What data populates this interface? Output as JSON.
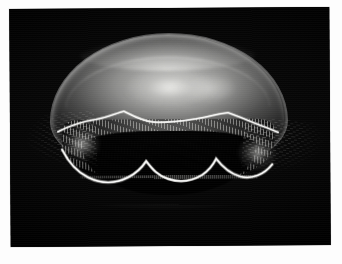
{
  "page": {
    "background_color": "#ffffff",
    "width": 342,
    "height": 264
  },
  "photo": {
    "subject": "moon-jellyfish",
    "subject_common_name": "Moon jellyfish",
    "background_color": "#000000",
    "frame_border_color": "#d8d8d8",
    "alt_text": "A translucent moon jellyfish photographed against a solid black background, its domed bell glowing pale grey with a bright scalloped margin and fine hair-like tentacles trailing below and to each side.",
    "orientation": "landscape",
    "plate": {
      "left": 10,
      "top": 8,
      "width": 320,
      "height": 238
    }
  },
  "subject_parts": {
    "bell_label": "bell-dome",
    "gonad_label": "gonad-ring",
    "margin_label": "scalloped-bell-margin",
    "tentacle_label": "tentacle-fringe",
    "oral_arm_label": "oral-arms",
    "wisp_left_label": "left-tentacle-spray",
    "wisp_right_label": "right-tentacle-spray"
  },
  "palette": {
    "bell_highlight": "#ececea",
    "bell_midtone": "#b2b2b0",
    "bell_shadow": "#565656",
    "background": "#000000",
    "paper": "#fdfdfd"
  }
}
